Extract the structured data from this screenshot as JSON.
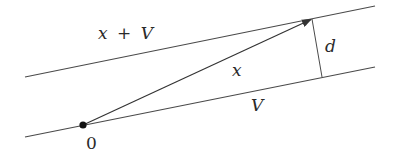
{
  "diagram": {
    "colors": {
      "stroke": "#4a4a4a",
      "arrow": "#333333",
      "dot": "#111111",
      "text": "#2a2a2a"
    },
    "nodes": [
      {
        "id": "origin",
        "label": "0",
        "x": 83,
        "y": 125
      },
      {
        "id": "x-tip",
        "label": "",
        "x": 312,
        "y": 19
      },
      {
        "id": "foot",
        "label": "",
        "x": 322,
        "y": 77
      }
    ],
    "edges": [
      {
        "id": "line-x-plus-V",
        "from": [
          25,
          77
        ],
        "to": [
          375,
          6
        ],
        "label": "x + V"
      },
      {
        "id": "line-V",
        "from": [
          25,
          137
        ],
        "to": [
          375,
          67
        ],
        "label": "V"
      },
      {
        "id": "vector-x",
        "from": "origin",
        "to": "x-tip",
        "label": "x",
        "arrow": true
      },
      {
        "id": "distance-d",
        "from": "x-tip",
        "to": "foot",
        "label": "d"
      }
    ],
    "labels": {
      "x_plus_V": "x + V",
      "x": "x",
      "V": "V",
      "d": "d",
      "zero": "0"
    }
  }
}
